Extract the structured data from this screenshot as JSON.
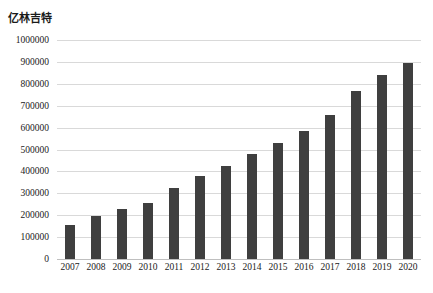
{
  "chart_data": {
    "type": "bar",
    "title": "",
    "ylabel": "亿林吉特",
    "xlabel": "",
    "categories": [
      "2007",
      "2008",
      "2009",
      "2010",
      "2011",
      "2012",
      "2013",
      "2014",
      "2015",
      "2016",
      "2017",
      "2018",
      "2019",
      "2020"
    ],
    "values": [
      155000,
      195000,
      228000,
      258000,
      325000,
      378000,
      425000,
      480000,
      532000,
      585000,
      658000,
      768000,
      840000,
      895000
    ],
    "ylim": [
      0,
      1000000
    ],
    "ytick_values": [
      1000000,
      900000,
      800000,
      700000,
      600000,
      500000,
      400000,
      300000,
      200000,
      100000,
      0
    ],
    "ytick_labels": [
      "1000000",
      "900000",
      "800000",
      "700000",
      "600000",
      "500000",
      "400000",
      "300000",
      "200000",
      "100000",
      "0"
    ],
    "grid": true,
    "legend": false,
    "legend_position": "none",
    "series": [
      {
        "name": "亿林吉特",
        "color": "#3f3f3f",
        "values": [
          155000,
          195000,
          228000,
          258000,
          325000,
          378000,
          425000,
          480000,
          532000,
          585000,
          658000,
          768000,
          840000,
          895000
        ]
      }
    ],
    "colors": {
      "bar": "#3f3f3f",
      "gridline": "#d9d9d9",
      "axis": "#bfbfbf",
      "text": "#1a1a1a",
      "background": "#ffffff"
    }
  }
}
